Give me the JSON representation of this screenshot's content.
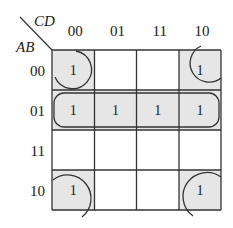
{
  "kmap": {
    "col_var": "CD",
    "row_var": "AB",
    "col_labels": [
      "00",
      "01",
      "11",
      "10"
    ],
    "row_labels": [
      "00",
      "01",
      "11",
      "10"
    ],
    "cells": [
      [
        "1",
        "",
        "",
        "1"
      ],
      [
        "1",
        "1",
        "1",
        "1"
      ],
      [
        "",
        "",
        "",
        ""
      ],
      [
        "1",
        "",
        "",
        "1"
      ]
    ],
    "groups": [
      {
        "name": "row-01-group",
        "cells": [
          [
            1,
            0
          ],
          [
            1,
            1
          ],
          [
            1,
            2
          ],
          [
            1,
            3
          ]
        ]
      },
      {
        "name": "corners-group",
        "cells": [
          [
            0,
            0
          ],
          [
            0,
            3
          ],
          [
            3,
            0
          ],
          [
            3,
            3
          ]
        ]
      }
    ],
    "shade_color": "#e6e6e6",
    "line_color": "#333333"
  }
}
